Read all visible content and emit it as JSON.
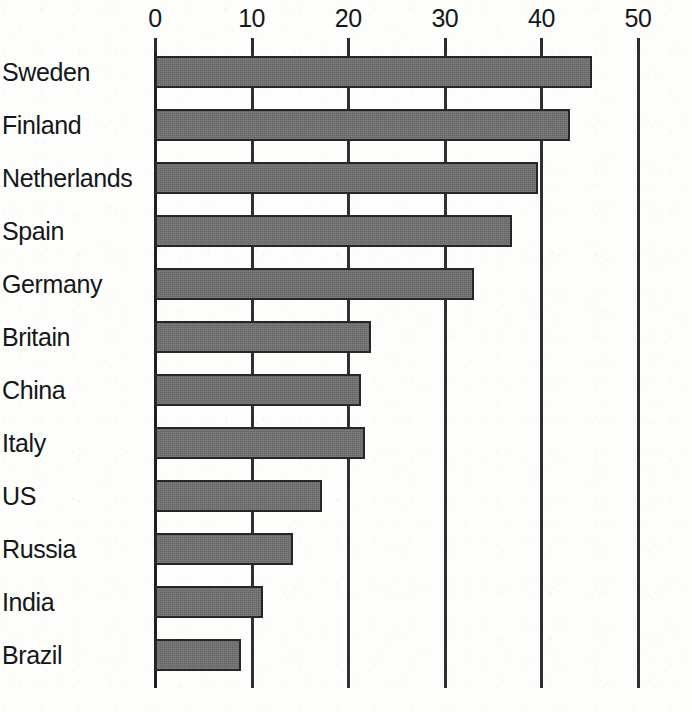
{
  "chart_data": {
    "type": "bar",
    "orientation": "horizontal",
    "title": "",
    "subtitle": "",
    "xlabel": "",
    "ylabel": "",
    "categories": [
      "Sweden",
      "Finland",
      "Netherlands",
      "Spain",
      "Germany",
      "Britain",
      "China",
      "Italy",
      "US",
      "Russia",
      "India",
      "Brazil"
    ],
    "values": [
      45.2,
      43.0,
      39.6,
      37.0,
      33.0,
      22.4,
      21.3,
      21.7,
      17.3,
      14.3,
      11.2,
      8.9
    ],
    "series": [
      {
        "name": "value",
        "values": [
          45.2,
          43.0,
          39.6,
          37.0,
          33.0,
          22.4,
          21.3,
          21.7,
          17.3,
          14.3,
          11.2,
          8.9
        ]
      }
    ],
    "xlim": [
      0,
      50
    ],
    "xticks": [
      0,
      10,
      20,
      30,
      40,
      50
    ],
    "xtick_labels": [
      "0",
      "10",
      "20",
      "30",
      "40",
      "50"
    ],
    "grid": true,
    "grid_axis": "x",
    "legend": false,
    "legend_position": "none",
    "bar_color": "#6f6f6f",
    "bar_edge_color": "#262626",
    "axis_color": "#2e3134",
    "background_color": "#fdfdfb",
    "text_color": "#141719",
    "annotations": []
  },
  "layout": {
    "plot_left_px": 155,
    "plot_right_px": 638,
    "plot_top_px": 52,
    "plot_bottom_px": 688,
    "bar_height_px": 32,
    "bar_pitch_px": 53,
    "first_bar_top_px": 56
  }
}
